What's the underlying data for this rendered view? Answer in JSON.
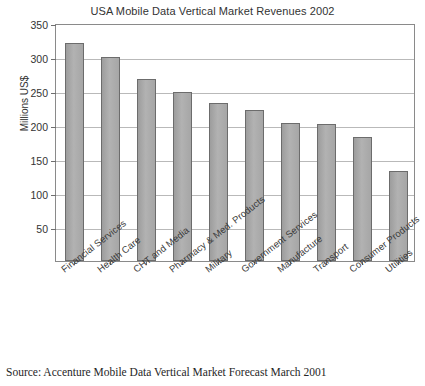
{
  "chart_data": {
    "type": "bar",
    "title": "USA Mobile Data Vertical Market Revenues 2002",
    "xlabel": "",
    "ylabel": "Millions US$",
    "ylim": [
      0,
      350
    ],
    "yticks": [
      50,
      100,
      150,
      200,
      250,
      300,
      350
    ],
    "ytick_labels": [
      "50",
      "100",
      "150",
      "200",
      "250",
      "300",
      "350"
    ],
    "grid": true,
    "legend": "none",
    "categories": [
      "Financial Services",
      "Health Care",
      "CHT and Media",
      "Pharmacy & Med. Products",
      "Military",
      "Government Services",
      "Manufacture",
      "Transport",
      "Consumer Products",
      "Utilities"
    ],
    "values": [
      320,
      300,
      268,
      249,
      232,
      222,
      203,
      202,
      183,
      133
    ],
    "bar_color": "#a9a9a9",
    "bar_edge_color": "#6c6c6c"
  },
  "source": {
    "note": "Source:  Accenture Mobile Data Vertical Market Forecast March 2001"
  }
}
